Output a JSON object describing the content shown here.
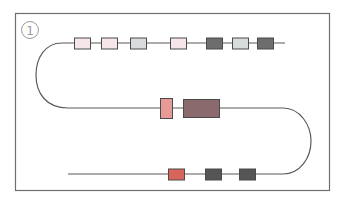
{
  "figure": {
    "label": "①",
    "colors": {
      "frame": "#6e6e6e",
      "line": "#5a5a5a",
      "pale_pink": "#f6e6ea",
      "light_gray": "#d8dcdc",
      "dark_gray": "#6d6d6d",
      "salmon": "#e79a96",
      "brown": "#8a6a6c",
      "red": "#d8655c",
      "charcoal": "#555555",
      "box_stroke": "#4a4a4a"
    },
    "strand_top": {
      "boxes": [
        {
          "x": 74,
          "fill": "pale_pink"
        },
        {
          "x": 101,
          "fill": "pale_pink"
        },
        {
          "x": 130,
          "fill": "light_gray"
        },
        {
          "x": 170,
          "fill": "pale_pink"
        },
        {
          "x": 206,
          "fill": "dark_gray"
        },
        {
          "x": 232,
          "fill": "light_gray"
        },
        {
          "x": 257,
          "fill": "dark_gray"
        }
      ]
    },
    "strand_middle": {
      "boxes": [
        {
          "x": 160,
          "w": 12,
          "h": 20,
          "fill": "salmon"
        },
        {
          "x": 183,
          "w": 36,
          "h": 18,
          "fill": "brown"
        }
      ]
    },
    "strand_bottom": {
      "boxes": [
        {
          "x": 168,
          "fill": "red"
        },
        {
          "x": 205,
          "fill": "charcoal"
        },
        {
          "x": 239,
          "fill": "charcoal"
        }
      ]
    }
  }
}
